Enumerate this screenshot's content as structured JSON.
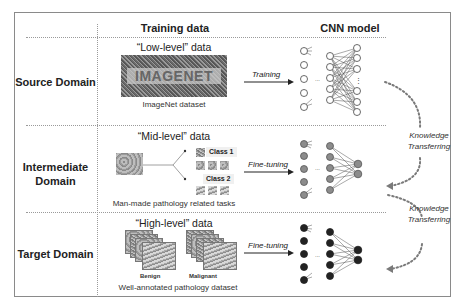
{
  "columns": {
    "training_data": "Training data",
    "cnn_model": "CNN model"
  },
  "rows": [
    {
      "label": "Source Domain",
      "data_level": "“Low-level” data",
      "image_text": "IMAGENET",
      "caption": "ImageNet dataset",
      "arrow_label": "Training",
      "network_style": "open-circles-fully-connected"
    },
    {
      "label_line1": "Intermediate",
      "label_line2": "Domain",
      "data_level": "“Mid-level” data",
      "class1": "Class 1",
      "class2": "Class 2",
      "caption": "Man-made pathology related tasks",
      "arrow_label": "Fine-tuning",
      "network_style": "gray-filled-circles"
    },
    {
      "label": "Target Domain",
      "data_level": "“High-level” data",
      "benign": "Benign",
      "malignant": "Malignant",
      "caption": "Well-annotated pathology dataset",
      "arrow_label": "Fine-tuning",
      "network_style": "black-filled-circles"
    }
  ],
  "transfers": [
    {
      "line1": "Knowledge",
      "line2": "Transferring"
    },
    {
      "line1": "Knowledge",
      "line2": "Transferring"
    }
  ],
  "ellipsis": "...",
  "vdots": "⋮",
  "colors": {
    "frame": "#8a8a8a",
    "divider": "#9a9a9a",
    "node_open": "#ffffff",
    "node_mid": "#8c8c8c",
    "node_target": "#222222",
    "transfer_dots": "#7a7a7a"
  }
}
